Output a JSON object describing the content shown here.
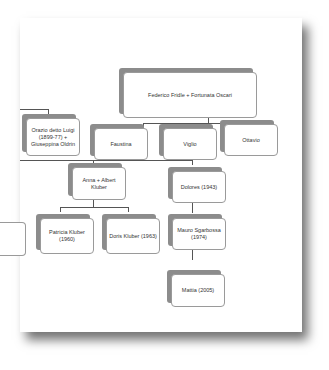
{
  "diagram": {
    "type": "family-tree",
    "root": {
      "label": "Federico Fridle + Fortunata Oscari"
    },
    "generation1": [
      {
        "label": "Orazio detto Luigi (1899-77) + Giuseppina Oldrin"
      },
      {
        "label": "Faustina"
      },
      {
        "label": "Viglio"
      },
      {
        "label": "Ottavio"
      }
    ],
    "generation2": [
      {
        "label": "Anna + Albert Kluber"
      },
      {
        "label": "Dolores (1943)"
      }
    ],
    "generation3": [
      {
        "label": ""
      },
      {
        "label": "Patricia Kluber (1960)"
      },
      {
        "label": "Doris Kluber (1963)"
      },
      {
        "label": "Mauro Sgarbossa (1974)"
      }
    ],
    "generation4": [
      {
        "label": "Mattia (2005)"
      }
    ]
  }
}
